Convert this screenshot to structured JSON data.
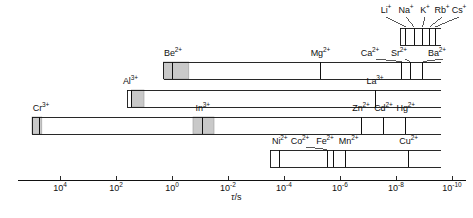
{
  "figure": {
    "axis_label": "τ/s",
    "axis_label_tau": "τ",
    "axis_label_unit": "/s",
    "colors": {
      "line": "#111111",
      "shaded_box": "#c9c9c9",
      "shaded_box_edge": "#9a9a9a",
      "background": "#ffffff"
    }
  },
  "chart_data": {
    "type": "bar",
    "title": "",
    "subtitle": "",
    "xlabel": "τ/s",
    "ylabel": "",
    "grid": false,
    "legend": false,
    "x_axis": {
      "scale": "log10",
      "reversed": true,
      "min_exponent": -10,
      "max_exponent": 5,
      "tick_exponents": [
        4,
        2,
        0,
        -2,
        -4,
        -6,
        -8,
        -10
      ],
      "tick_labels": [
        "10⁴",
        "10²",
        "10⁰",
        "10⁻²",
        "10⁻⁴",
        "10⁻⁶",
        "10⁻⁸",
        "10⁻¹⁰"
      ],
      "tick_bases": [
        "10",
        "10",
        "10",
        "10",
        "10",
        "10",
        "10",
        "10"
      ],
      "tick_exps": [
        "4",
        "2",
        "0",
        "-2",
        "-4",
        "-6",
        "-8",
        "-10"
      ]
    },
    "bars": [
      {
        "name": "alkali-row",
        "row": 0,
        "start_exponent": -8.15,
        "end_exponent": -9.6,
        "ions": [
          {
            "label": "Li",
            "charge": "+",
            "exponent": -8.35
          },
          {
            "label": "Na",
            "charge": "+",
            "exponent": -8.65
          },
          {
            "label": "K",
            "charge": "+",
            "exponent": -8.95
          },
          {
            "label": "Rb",
            "charge": "+",
            "exponent": -9.2
          },
          {
            "label": "Cs",
            "charge": "+",
            "exponent": -9.4
          }
        ],
        "shaded": []
      },
      {
        "name": "alkaline-earth-row",
        "row": 1,
        "start_exponent": 0.3,
        "end_exponent": -9.6,
        "ions": [
          {
            "label": "Be",
            "charge": "2+",
            "exponent": 0.0
          },
          {
            "label": "Mg",
            "charge": "2+",
            "exponent": -5.3
          },
          {
            "label": "Ca",
            "charge": "2+",
            "exponent": -8.2
          },
          {
            "label": "Sr",
            "charge": "2+",
            "exponent": -8.5
          },
          {
            "label": "Ba",
            "charge": "2+",
            "exponent": -8.95
          }
        ],
        "shaded": [
          {
            "from_exponent": 0.3,
            "to_exponent": -0.6
          }
        ]
      },
      {
        "name": "trivalent-row",
        "row": 2,
        "start_exponent": 1.6,
        "end_exponent": -9.6,
        "ions": [
          {
            "label": "Al",
            "charge": "3+",
            "exponent": 1.45
          },
          {
            "label": "La",
            "charge": "3+",
            "exponent": -7.25
          }
        ],
        "shaded": [
          {
            "from_exponent": 1.45,
            "to_exponent": 1.0
          }
        ]
      },
      {
        "name": "cr-in-zn-row",
        "row": 3,
        "start_exponent": 5.0,
        "end_exponent": -9.6,
        "ions": [
          {
            "label": "Cr",
            "charge": "3+",
            "exponent": 4.75
          },
          {
            "label": "In",
            "charge": "3+",
            "exponent": -1.1
          },
          {
            "label": "Zn",
            "charge": "2+",
            "exponent": -6.75
          },
          {
            "label": "Cd",
            "charge": "2+",
            "exponent": -7.55
          },
          {
            "label": "Hg",
            "charge": "2+",
            "exponent": -8.35
          }
        ],
        "shaded": [
          {
            "from_exponent": 5.0,
            "to_exponent": 4.65
          },
          {
            "from_exponent": -0.75,
            "to_exponent": -1.5
          }
        ]
      },
      {
        "name": "transition-metal-row",
        "row": 4,
        "start_exponent": -3.5,
        "end_exponent": -9.6,
        "ions": [
          {
            "label": "Ni",
            "charge": "2+",
            "exponent": -3.85
          },
          {
            "label": "Co",
            "charge": "2+",
            "exponent": -5.55
          },
          {
            "label": "Fe",
            "charge": "2+",
            "exponent": -5.75
          },
          {
            "label": "Mn",
            "charge": "2+",
            "exponent": -6.2
          },
          {
            "label": "Cu",
            "charge": "2+",
            "exponent": -8.45
          }
        ],
        "shaded": []
      }
    ]
  }
}
